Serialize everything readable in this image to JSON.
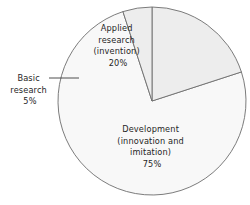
{
  "chart_data": {
    "type": "pie",
    "title": "",
    "subtitle": "",
    "xlabel": "",
    "ylabel": "",
    "legend_position": "none",
    "grid": false,
    "categories": [
      "Applied research (invention)",
      "Development (innovation and imitation)",
      "Basic research"
    ],
    "values": [
      20,
      75,
      5
    ],
    "units": "percent",
    "total": 100,
    "start_angle_deg": 0,
    "direction": "clockwise",
    "series": [
      {
        "name": "Share of research spending",
        "values": [
          20,
          75,
          5
        ]
      }
    ],
    "slices": [
      {
        "id": "applied-research",
        "label": "Applied research (invention)",
        "value": 20,
        "value_label": "20%",
        "start_angle_deg": 0,
        "end_angle_deg": 72,
        "color": "#ededed",
        "label_placement": "inside"
      },
      {
        "id": "development",
        "label": "Development (innovation and imitation)",
        "value": 75,
        "value_label": "75%",
        "start_angle_deg": 72,
        "end_angle_deg": 342,
        "color": "#f8f8f8",
        "label_placement": "inside"
      },
      {
        "id": "basic-research",
        "label": "Basic research",
        "value": 5,
        "value_label": "5%",
        "start_angle_deg": 342,
        "end_angle_deg": 360,
        "color": "#ededed",
        "label_placement": "outside-left-with-leader"
      }
    ]
  },
  "labels": {
    "applied": {
      "line1": "Applied",
      "line2": "research",
      "line3": "(invention)",
      "line4": "20%"
    },
    "development": {
      "line1": "Development",
      "line2": "(innovation and",
      "line3": "imitation)",
      "line4": "75%"
    },
    "basic": {
      "line1": "Basic",
      "line2": "research",
      "line3": "5%"
    }
  },
  "style": {
    "outline_color": "#6d6d6d",
    "leader_color": "#3a3a3a",
    "text_color": "#262626",
    "background": "#ffffff",
    "slice_gray": "#ededed",
    "slice_light": "#f8f8f8"
  },
  "geometry": {
    "center_x": 152,
    "center_y": 101,
    "radius": 94
  }
}
